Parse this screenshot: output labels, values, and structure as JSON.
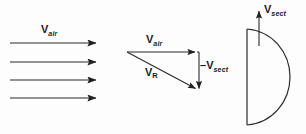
{
  "figure": {
    "background_color": "#fdfdfd",
    "line_color": "#2b2b2b",
    "text_color": "#1b1b1b",
    "width": 306,
    "height": 134
  },
  "labels": {
    "vair_flow": {
      "symbol": "V",
      "subscript": "air",
      "full": "Vair"
    },
    "vair_triangle": {
      "symbol": "V",
      "subscript": "air",
      "full": "Vair"
    },
    "vr": {
      "symbol": "V",
      "subscript": "R",
      "full": "VR"
    },
    "vsect_negative": {
      "sign": "–",
      "symbol": "V",
      "subscript": "sect",
      "full": "–Vsect"
    },
    "vsect_positive": {
      "symbol": "V",
      "subscript": "sect",
      "full": "Vsect"
    }
  },
  "freestream_arrows": {
    "count": 4,
    "x_start": 10,
    "x_end": 98,
    "y_positions": [
      43,
      62,
      80,
      98
    ],
    "direction": "right",
    "label": "Vair"
  },
  "velocity_triangle": {
    "apex_left": [
      127,
      52
    ],
    "top_right": [
      197,
      52
    ],
    "bottom_right": [
      199,
      91
    ],
    "vectors": [
      {
        "name": "Vair",
        "from": [
          127,
          52
        ],
        "to": [
          197,
          52
        ],
        "direction": "right",
        "label": "Vair"
      },
      {
        "name": "-Vsect",
        "from": [
          199,
          52
        ],
        "to": [
          199,
          91
        ],
        "direction": "down",
        "label": "–Vsect"
      },
      {
        "name": "VR",
        "from": [
          127,
          52
        ],
        "to": [
          199,
          91
        ],
        "direction": "down-right",
        "label": "VR"
      }
    ]
  },
  "section_shape": {
    "type": "semicircle-d-shape",
    "flat_side": "left",
    "flat_top": [
      247,
      29
    ],
    "flat_bottom": [
      247,
      125
    ],
    "arc_extent_x": 290,
    "arrow": {
      "name": "Vsect",
      "from": [
        259,
        44
      ],
      "to": [
        259,
        8
      ],
      "direction": "up",
      "label": "Vsect"
    }
  }
}
